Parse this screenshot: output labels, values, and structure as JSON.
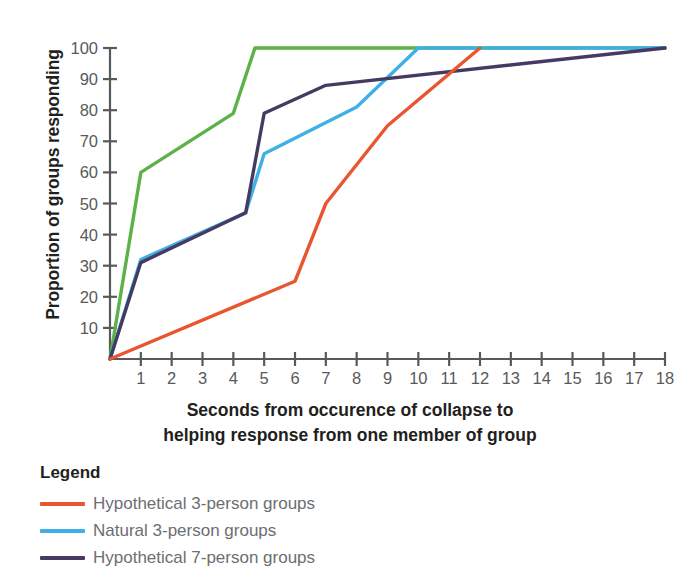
{
  "chart_data": {
    "type": "line",
    "title": "",
    "xlabel": "Seconds from occurence of collapse to helping response from one member of group",
    "xlabel_line1": "Seconds from occurence of collapse to",
    "xlabel_line2": "helping response from one member of group",
    "ylabel": "Proportion of groups responding",
    "xlim": [
      0,
      18
    ],
    "ylim": [
      0,
      100
    ],
    "grid": false,
    "legend_position": "below-left",
    "x_ticks": [
      1,
      2,
      3,
      4,
      5,
      6,
      7,
      8,
      9,
      10,
      11,
      12,
      13,
      14,
      15,
      16,
      17,
      18
    ],
    "y_ticks": [
      10,
      20,
      30,
      40,
      50,
      60,
      70,
      80,
      90,
      100
    ],
    "series": [
      {
        "name": "Natural 7-person groups",
        "color": "#5CB246",
        "x": [
          0,
          1,
          4,
          4.7,
          18
        ],
        "y": [
          0,
          60,
          79,
          100,
          100
        ]
      },
      {
        "name": "Natural 3-person groups",
        "color": "#3FAFE8",
        "x": [
          0,
          1,
          4.4,
          5,
          8,
          10,
          18
        ],
        "y": [
          0,
          32,
          47,
          66,
          81,
          100,
          100
        ]
      },
      {
        "name": "Hypothetical 7-person groups",
        "color": "#463A63",
        "x": [
          0,
          1,
          4.4,
          5,
          7,
          18
        ],
        "y": [
          0,
          31,
          47,
          79,
          88,
          100
        ]
      },
      {
        "name": "Hypothetical 3-person groups",
        "color": "#E8562F",
        "x": [
          0,
          6,
          7,
          9,
          12
        ],
        "y": [
          0,
          25,
          50,
          75,
          100
        ]
      }
    ]
  },
  "axes": {
    "y_title": "Proportion of groups responding",
    "x_title_line1": "Seconds from occurence of collapse to",
    "x_title_line2": "helping response from one member of group",
    "y_tick_labels": [
      "10",
      "20",
      "30",
      "40",
      "50",
      "60",
      "70",
      "80",
      "90",
      "100"
    ],
    "x_tick_labels": [
      "1",
      "2",
      "3",
      "4",
      "5",
      "6",
      "7",
      "8",
      "9",
      "10",
      "11",
      "12",
      "13",
      "14",
      "15",
      "16",
      "17",
      "18"
    ]
  },
  "legend": {
    "title": "Legend",
    "items": [
      {
        "label": "Hypothetical 3-person groups",
        "color": "#E8562F"
      },
      {
        "label": "Natural 3-person groups",
        "color": "#3FAFE8"
      },
      {
        "label": "Hypothetical 7-person groups",
        "color": "#463A63"
      }
    ]
  },
  "colors": {
    "axis": "#58595b",
    "tick_text": "#58595b",
    "title_text": "#231f20",
    "legend_text": "#6d6e71",
    "background": "#ffffff"
  }
}
